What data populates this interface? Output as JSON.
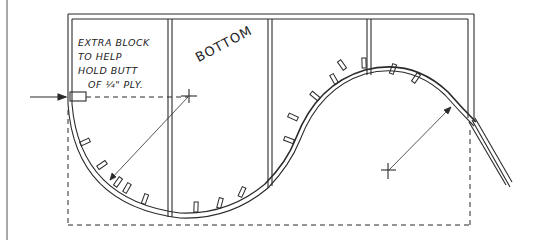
{
  "annotations": {
    "note_lines": [
      "EXTRA BLOCK",
      "TO HELP",
      "HOLD BUTT",
      "OF ¼\" PLY."
    ],
    "bottom_label": "BOTTOM"
  },
  "colors": {
    "ink": "#2a2a2a",
    "paper": "#ffffff"
  }
}
